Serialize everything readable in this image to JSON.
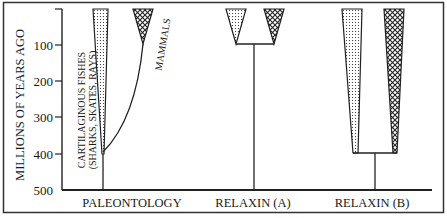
{
  "figure": {
    "y_axis": {
      "title": "MILLIONS OF YEARS AGO",
      "ticks": [
        "100",
        "200",
        "300",
        "400",
        "500"
      ]
    },
    "panels": [
      {
        "label": "PALEONTOLOGY",
        "lineages": [
          {
            "name": "CARTILAGINOUS FISHES",
            "sub": "(SHARKS, SKATES, RAYS)",
            "pattern": "dotted"
          },
          {
            "name": "MAMMALS",
            "pattern": "cross-hatched"
          }
        ],
        "divergence_mya": 400
      },
      {
        "label": "RELAXIN (A)",
        "lineages": [
          {
            "pattern": "dotted"
          },
          {
            "pattern": "cross-hatched"
          }
        ],
        "divergence_mya": 100
      },
      {
        "label": "RELAXIN (B)",
        "lineages": [
          {
            "pattern": "dotted"
          },
          {
            "pattern": "cross-hatched"
          }
        ],
        "divergence_mya": 400
      }
    ],
    "colors": {
      "ink": "#1a1a1a",
      "background": "#ffffff"
    }
  }
}
